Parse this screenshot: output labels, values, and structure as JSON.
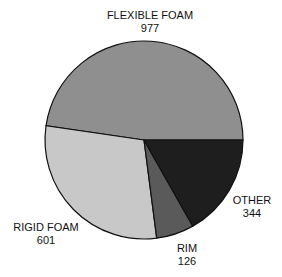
{
  "chart_data": {
    "type": "pie",
    "title": "",
    "categories": [
      "FLEXIBLE FOAM",
      "RIGID FOAM",
      "RIM",
      "OTHER"
    ],
    "values": [
      977,
      601,
      126,
      344
    ],
    "colors": [
      "#8f8f8f",
      "#c8c8c8",
      "#5a5a5a",
      "#1e1e1e"
    ],
    "labels": [
      {
        "name": "FLEXIBLE FOAM",
        "value": "977"
      },
      {
        "name": "RIGID FOAM",
        "value": "601"
      },
      {
        "name": "RIM",
        "value": "126"
      },
      {
        "name": "OTHER",
        "value": "344"
      }
    ]
  }
}
